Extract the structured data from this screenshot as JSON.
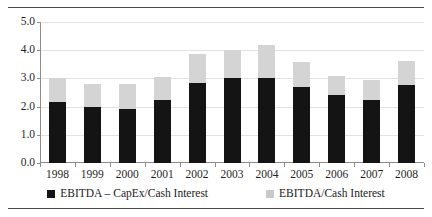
{
  "chart_data": {
    "type": "bar",
    "subtype": "stacked-bar",
    "title": "",
    "xlabel": "",
    "ylabel": "",
    "ylim": [
      0.0,
      5.0
    ],
    "ytick_values": [
      0.0,
      1.0,
      2.0,
      3.0,
      4.0,
      5.0
    ],
    "ytick_labels": [
      "0.0",
      "1.0",
      "2.0",
      "3.0",
      "4.0",
      "5.0"
    ],
    "grid": true,
    "grid_axis": "y",
    "legend_position": "bottom",
    "categories": [
      "1998",
      "1999",
      "2000",
      "2001",
      "2002",
      "2003",
      "2004",
      "2005",
      "2006",
      "2007",
      "2008"
    ],
    "series": [
      {
        "name": "EBITDA – CapEx/Cash Interest",
        "color": "#141414",
        "stack_role": "bottom",
        "values": [
          2.15,
          2.0,
          1.9,
          2.25,
          2.85,
          3.0,
          3.0,
          2.7,
          2.4,
          2.25,
          2.75
        ]
      },
      {
        "name": "EBITDA/Cash Interest",
        "color": "#d4d4d4",
        "stack_role": "top-total",
        "note": "Light segment is drawn from the dark segment top up to the total value below.",
        "values": [
          3.0,
          2.8,
          2.8,
          3.05,
          3.85,
          4.0,
          4.2,
          3.6,
          3.1,
          2.95,
          3.6
        ]
      }
    ]
  },
  "legend": {
    "entries": [
      {
        "label": "EBITDA – CapEx/Cash Interest",
        "swatch": "dark-square-icon"
      },
      {
        "label": "EBITDA/Cash Interest",
        "swatch": "light-square-icon"
      }
    ]
  },
  "colors": {
    "bar_dark": "#141414",
    "bar_light": "#d4d4d4",
    "axis": "#8c8c8c",
    "grid": "#e2e2e2",
    "rule": "#4a4a4a",
    "text": "#1a1a1a",
    "background": "#ffffff"
  }
}
